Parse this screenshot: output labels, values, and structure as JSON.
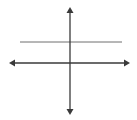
{
  "diagram": {
    "type": "coordinate-axes-with-horizontal-line",
    "width": 137,
    "height": 120,
    "colors": {
      "background": "#ffffff",
      "axis": "#3a3a3a",
      "line": "#6e6e6e"
    },
    "x_axis": {
      "x1": 9,
      "x2": 130,
      "y": 63,
      "arrows": [
        "left",
        "right"
      ]
    },
    "y_axis": {
      "x": 70,
      "y1": 7,
      "y2": 115,
      "arrows": [
        "up",
        "down"
      ]
    },
    "horizontal_line": {
      "x1": 20,
      "x2": 122,
      "y": 42,
      "arrows": []
    }
  }
}
